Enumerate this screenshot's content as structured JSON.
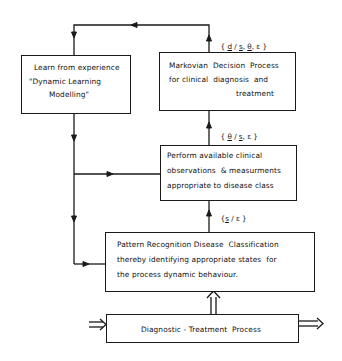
{
  "diagram": {
    "nodes": {
      "learn": {
        "lines": [
          "Learn from experience",
          "\"Dynamic Learning",
          "Modelling\""
        ]
      },
      "markovian": {
        "lines": [
          "Markovian  Decision  Process",
          "for clinical  diagnosis  and",
          "treatment"
        ]
      },
      "perform": {
        "lines": [
          "Perform available clinical",
          "observations  & measurments",
          "appropriate to disease class"
        ]
      },
      "pattern": {
        "lines": [
          "Pattern Recognition Disease  Classification",
          "thereby identifying appropriate states  for",
          "the process dynamic behaviour."
        ]
      },
      "diagnostic": {
        "label": "Diagnostic - Treatment  Process"
      }
    },
    "edge_labels": {
      "markovian_top": {
        "open": "{ ",
        "d": "d",
        "sep1": " / ",
        "s": "s",
        "sep2": ", ",
        "theta": "θ",
        "sep3": ", ",
        "eps": "ε",
        "close": " }"
      },
      "markovian_to_perform": {
        "open": "{ ",
        "theta": "θ",
        "sep1": " / ",
        "s": "s",
        "sep2": ", ",
        "eps": "ε",
        "close": " }"
      },
      "perform_to_pattern": {
        "open": "{",
        "s": "s",
        "sep1": " / ",
        "eps": "ε",
        "close": " }"
      }
    },
    "edges": [
      {
        "from": "markovian",
        "to": "learn",
        "via": "top-loop"
      },
      {
        "from": "learn",
        "to": "perform"
      },
      {
        "from": "learn",
        "to": "pattern"
      },
      {
        "from": "perform",
        "to": "markovian"
      },
      {
        "from": "pattern",
        "to": "perform"
      },
      {
        "from": "diagnostic",
        "to": "pattern",
        "style": "double-arrow"
      },
      {
        "from": "input",
        "to": "diagnostic",
        "style": "double-arrow"
      },
      {
        "from": "diagnostic",
        "to": "output",
        "style": "double-arrow"
      }
    ]
  }
}
